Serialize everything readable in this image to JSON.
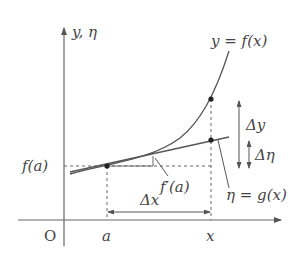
{
  "diagram": {
    "axes": {
      "y_label": "y, η",
      "origin_label": "O",
      "x_tick_a": "a",
      "x_tick_x": "x"
    },
    "curve": {
      "label": "y = f(x)"
    },
    "tangent": {
      "label": "η = g(x)"
    },
    "labels": {
      "f_a": "f(a)",
      "slope": "f′(a)",
      "delta_x": "Δx",
      "delta_y": "Δy",
      "delta_eta": "Δη"
    },
    "colors": {
      "ink": "#444444",
      "curve": "#555555",
      "dashed": "#666666"
    }
  }
}
